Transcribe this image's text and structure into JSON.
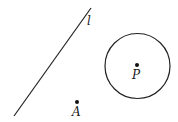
{
  "diagram": {
    "line": {
      "label": "l",
      "x1": 14,
      "y1": 116,
      "x2": 91,
      "y2": 8
    },
    "circle": {
      "cx": 137.5,
      "cy": 66,
      "r": 32.5
    },
    "point_P": {
      "label": "P",
      "x": 137,
      "y": 65
    },
    "point_A": {
      "label": "A",
      "x": 77,
      "y": 102
    },
    "stroke_color": "#222222"
  }
}
